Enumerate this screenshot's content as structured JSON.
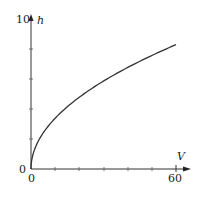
{
  "chart_data": {
    "type": "line",
    "title": "",
    "xlabel": "V",
    "ylabel": "h",
    "xlim": [
      0,
      60
    ],
    "ylim": [
      0,
      10
    ],
    "x_ticks": [
      0,
      10,
      20,
      30,
      40,
      50,
      60
    ],
    "x_tick_labels": [
      "0",
      "60"
    ],
    "y_tick_labels": [
      "0",
      "10"
    ],
    "grid": false,
    "legend": null,
    "series": [
      {
        "name": "h(V)",
        "x": [
          0,
          1,
          2.5,
          5,
          10,
          15,
          20,
          30,
          40,
          50,
          60
        ],
        "values": [
          0,
          1.07,
          1.69,
          2.39,
          3.38,
          4.14,
          4.79,
          5.86,
          6.77,
          7.57,
          8.29
        ]
      }
    ]
  },
  "axes": {
    "y_top_label": "10",
    "y_axis_name": "h",
    "origin_y_label": "0",
    "origin_x_label": "0",
    "x_end_label": "60",
    "x_axis_name": "V"
  }
}
